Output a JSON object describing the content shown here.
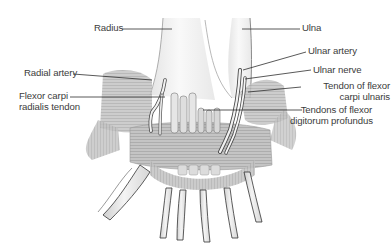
{
  "diagram": {
    "labels_left": [
      {
        "id": "radius",
        "lines": [
          "Radius"
        ]
      },
      {
        "id": "radial-artery",
        "lines": [
          "Radial artery"
        ]
      },
      {
        "id": "flexor-carpi-radialis-tendon",
        "lines": [
          "Flexor carpi",
          "radialis tendon"
        ]
      }
    ],
    "labels_right": [
      {
        "id": "ulna",
        "lines": [
          "Ulna"
        ]
      },
      {
        "id": "ulnar-artery",
        "lines": [
          "Ulnar artery"
        ]
      },
      {
        "id": "ulnar-nerve",
        "lines": [
          "Ulnar nerve"
        ]
      },
      {
        "id": "tendon-of-flexor-carpi-ulnaris",
        "lines": [
          "Tendon of flexor",
          "carpi ulnaris"
        ]
      },
      {
        "id": "tendons-of-flexor-digitorum-profundus",
        "lines": [
          "Tendons of flexor",
          "digitorum profundus"
        ]
      }
    ],
    "colors": {
      "line": "#2f2f2f",
      "text": "#3c3c3c",
      "bone": "#ededed",
      "tissue": "#bdbdbd",
      "shadow": "#8f8f8f"
    }
  }
}
